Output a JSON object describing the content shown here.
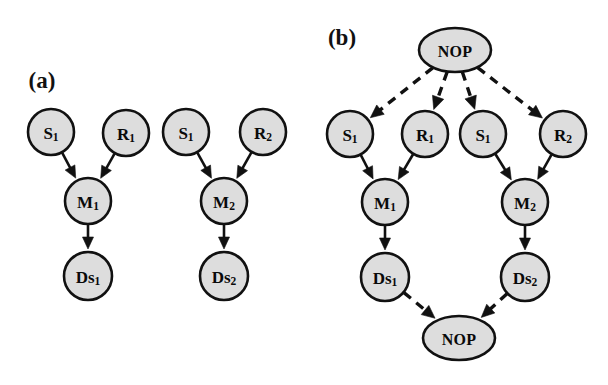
{
  "figure": {
    "background_color": "#ffffff",
    "node_fill_color": "#dddddd",
    "node_stroke_color": "#111111",
    "edge_color": "#111111",
    "width": 608,
    "height": 385
  },
  "panels": [
    {
      "id": "a",
      "label": "(a)",
      "label_x": 42,
      "label_y": 88,
      "description": "Two independent chains, no NOP nodes",
      "nodes": [
        {
          "id": "a-s1-1",
          "name": "S",
          "sub": "1",
          "display": "S1",
          "shape": "circle",
          "cx": 51,
          "cy": 132,
          "rx": 23,
          "ry": 23
        },
        {
          "id": "a-r1",
          "name": "R",
          "sub": "1",
          "display": "R1",
          "shape": "circle",
          "cx": 126,
          "cy": 133,
          "rx": 23,
          "ry": 23
        },
        {
          "id": "a-m1",
          "name": "M",
          "sub": "1",
          "display": "M1",
          "shape": "circle",
          "cx": 88,
          "cy": 201,
          "rx": 23,
          "ry": 23
        },
        {
          "id": "a-ds1",
          "name": "Ds",
          "sub": "1",
          "display": "Ds1",
          "shape": "circle",
          "cx": 88,
          "cy": 276,
          "rx": 24,
          "ry": 24
        },
        {
          "id": "a-s1-2",
          "name": "S",
          "sub": "1",
          "display": "S1",
          "shape": "circle",
          "cx": 186,
          "cy": 132,
          "rx": 23,
          "ry": 23
        },
        {
          "id": "a-r2",
          "name": "R",
          "sub": "2",
          "display": "R2",
          "shape": "circle",
          "cx": 263,
          "cy": 132,
          "rx": 23,
          "ry": 23
        },
        {
          "id": "a-m2",
          "name": "M",
          "sub": "2",
          "display": "M2",
          "shape": "circle",
          "cx": 224,
          "cy": 201,
          "rx": 23,
          "ry": 23
        },
        {
          "id": "a-ds2",
          "name": "Ds",
          "sub": "2",
          "display": "Ds2",
          "shape": "circle",
          "cx": 224,
          "cy": 276,
          "rx": 24,
          "ry": 24
        }
      ],
      "edges": [
        {
          "from": "a-s1-1",
          "to": "a-m1",
          "style": "solid"
        },
        {
          "from": "a-r1",
          "to": "a-m1",
          "style": "solid"
        },
        {
          "from": "a-m1",
          "to": "a-ds1",
          "style": "solid"
        },
        {
          "from": "a-s1-2",
          "to": "a-m2",
          "style": "solid"
        },
        {
          "from": "a-r2",
          "to": "a-m2",
          "style": "solid"
        },
        {
          "from": "a-m2",
          "to": "a-ds2",
          "style": "solid"
        }
      ]
    },
    {
      "id": "b",
      "label": "(b)",
      "label_x": 342,
      "label_y": 45,
      "description": "Two chains joined by a top NOP and a bottom NOP via dashed edges",
      "nodes": [
        {
          "id": "b-nop-top",
          "name": "NOP",
          "sub": "",
          "display": "NOP",
          "shape": "ellipse",
          "cx": 455,
          "cy": 50,
          "rx": 36,
          "ry": 22
        },
        {
          "id": "b-s1-1",
          "name": "S",
          "sub": "1",
          "display": "S1",
          "shape": "circle",
          "cx": 350,
          "cy": 134,
          "rx": 23,
          "ry": 23
        },
        {
          "id": "b-r1",
          "name": "R",
          "sub": "1",
          "display": "R1",
          "shape": "circle",
          "cx": 425,
          "cy": 134,
          "rx": 23,
          "ry": 23
        },
        {
          "id": "b-s1-2",
          "name": "S",
          "sub": "1",
          "display": "S1",
          "shape": "circle",
          "cx": 483,
          "cy": 134,
          "rx": 23,
          "ry": 23
        },
        {
          "id": "b-r2",
          "name": "R",
          "sub": "2",
          "display": "R2",
          "shape": "circle",
          "cx": 563,
          "cy": 134,
          "rx": 23,
          "ry": 23
        },
        {
          "id": "b-m1",
          "name": "M",
          "sub": "1",
          "display": "M1",
          "shape": "circle",
          "cx": 385,
          "cy": 202,
          "rx": 23,
          "ry": 23
        },
        {
          "id": "b-m2",
          "name": "M",
          "sub": "2",
          "display": "M2",
          "shape": "circle",
          "cx": 525,
          "cy": 202,
          "rx": 23,
          "ry": 23
        },
        {
          "id": "b-ds1",
          "name": "Ds",
          "sub": "1",
          "display": "Ds1",
          "shape": "circle",
          "cx": 385,
          "cy": 277,
          "rx": 24,
          "ry": 24
        },
        {
          "id": "b-ds2",
          "name": "Ds",
          "sub": "2",
          "display": "Ds2",
          "shape": "circle",
          "cx": 525,
          "cy": 277,
          "rx": 24,
          "ry": 24
        },
        {
          "id": "b-nop-bot",
          "name": "NOP",
          "sub": "",
          "display": "NOP",
          "shape": "ellipse",
          "cx": 459,
          "cy": 338,
          "rx": 36,
          "ry": 22
        }
      ],
      "edges": [
        {
          "from": "b-nop-top",
          "to": "b-s1-1",
          "style": "dashed"
        },
        {
          "from": "b-nop-top",
          "to": "b-r1",
          "style": "dashed"
        },
        {
          "from": "b-nop-top",
          "to": "b-s1-2",
          "style": "dashed"
        },
        {
          "from": "b-nop-top",
          "to": "b-r2",
          "style": "dashed"
        },
        {
          "from": "b-s1-1",
          "to": "b-m1",
          "style": "solid"
        },
        {
          "from": "b-r1",
          "to": "b-m1",
          "style": "solid"
        },
        {
          "from": "b-m1",
          "to": "b-ds1",
          "style": "solid"
        },
        {
          "from": "b-s1-2",
          "to": "b-m2",
          "style": "solid"
        },
        {
          "from": "b-r2",
          "to": "b-m2",
          "style": "solid"
        },
        {
          "from": "b-m2",
          "to": "b-ds2",
          "style": "solid"
        },
        {
          "from": "b-ds1",
          "to": "b-nop-bot",
          "style": "dashed"
        },
        {
          "from": "b-ds2",
          "to": "b-nop-bot",
          "style": "dashed"
        }
      ]
    }
  ]
}
